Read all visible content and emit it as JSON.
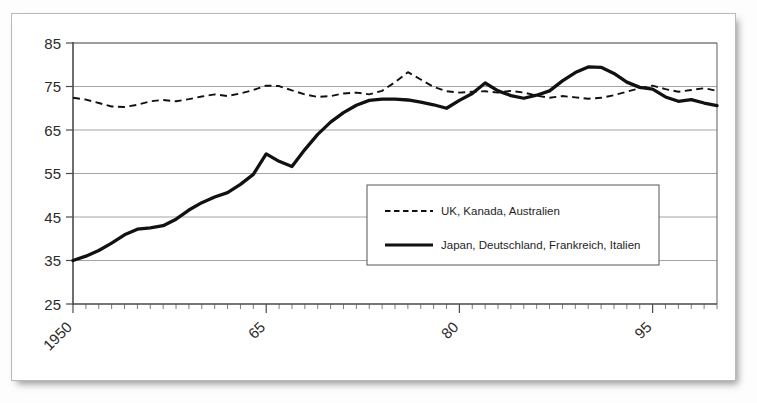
{
  "chart_data": {
    "type": "line",
    "title": "",
    "xlabel": "",
    "ylabel": "",
    "xlim": [
      1950,
      2000
    ],
    "ylim": [
      25,
      85
    ],
    "grid": true,
    "legend_position": "center-right",
    "y_ticks": [
      25,
      35,
      45,
      55,
      65,
      75,
      85
    ],
    "y_tick_labels": [
      "25",
      "35",
      "45",
      "55",
      "65",
      "75",
      "85"
    ],
    "x_ticks": [
      1950,
      1965,
      1980,
      1995
    ],
    "x_tick_labels": [
      "1950",
      "65",
      "80",
      "95"
    ],
    "x_minor_tick_step": 1,
    "x": [
      1950,
      1951,
      1952,
      1953,
      1954,
      1955,
      1956,
      1957,
      1958,
      1959,
      1960,
      1961,
      1962,
      1963,
      1964,
      1965,
      1966,
      1967,
      1968,
      1969,
      1970,
      1971,
      1972,
      1973,
      1974,
      1975,
      1976,
      1977,
      1978,
      1979,
      1980,
      1981,
      1982,
      1983,
      1984,
      1985,
      1986,
      1987,
      1988,
      1989,
      1990,
      1991,
      1992,
      1993,
      1994,
      1995,
      1996,
      1997,
      1998,
      1999,
      2000
    ],
    "series": [
      {
        "name": "UK, Kanada, Australien",
        "style": "dashed",
        "color": "#111111",
        "values": [
          72.4,
          72.0,
          71.2,
          70.4,
          70.3,
          70.8,
          71.6,
          71.9,
          71.6,
          72.1,
          72.7,
          73.2,
          72.8,
          73.4,
          74.2,
          75.2,
          75.1,
          74.1,
          73.2,
          72.6,
          72.8,
          73.4,
          73.6,
          73.2,
          74.0,
          76.0,
          78.3,
          76.6,
          74.9,
          73.9,
          73.6,
          73.8,
          73.9,
          73.6,
          74.0,
          73.6,
          72.9,
          72.4,
          72.8,
          72.5,
          72.2,
          72.4,
          73.0,
          73.8,
          74.6,
          75.2,
          74.4,
          73.8,
          74.2,
          74.6,
          74.0
        ]
      },
      {
        "name": "Japan, Deutschland, Frankreich, Italien",
        "style": "solid",
        "color": "#111111",
        "values": [
          35.0,
          36.0,
          37.3,
          39.0,
          40.9,
          42.2,
          42.5,
          43.0,
          44.5,
          46.6,
          48.3,
          49.6,
          50.6,
          52.5,
          54.8,
          59.5,
          57.8,
          56.6,
          60.5,
          64.0,
          66.8,
          69.0,
          70.7,
          71.8,
          72.1,
          72.1,
          71.9,
          71.4,
          70.8,
          70.0,
          71.8,
          73.4,
          75.8,
          74.0,
          72.9,
          72.3,
          73.0,
          74.0,
          76.3,
          78.2,
          79.5,
          79.4,
          78.0,
          76.0,
          74.8,
          74.4,
          72.6,
          71.6,
          72.0,
          71.2,
          70.6
        ]
      }
    ]
  },
  "legend": {
    "entries": [
      {
        "label": "UK, Kanada, Australien",
        "style": "dashed"
      },
      {
        "label": "Japan, Deutschland, Frankreich, Italien",
        "style": "solid"
      }
    ]
  }
}
